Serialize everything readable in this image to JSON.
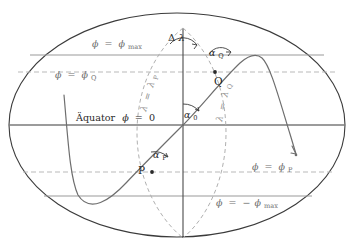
{
  "figure": {
    "type": "great-circle-geodesy-diagram",
    "language": "de",
    "background": "#ffffff",
    "size": {
      "width": 355,
      "height": 250
    }
  },
  "colors": {
    "ellipse_outline": "#3b3b3b",
    "equator_line": "#7a7a7a",
    "parallel_solid": "#9a9a9a",
    "parallel_dashed": "#b9b9b9",
    "meridian_dashed": "#b0b0b0",
    "great_circle": "#6e6e6e",
    "text": "#2a2a2a",
    "text_faint": "#6f6f6f",
    "angle_arc": "#3b3b3b"
  },
  "labels": {
    "equator": "Äquator ϕ = 0",
    "phi_max": "ϕ = ϕmax",
    "phi_q": "ϕ = ϕQ",
    "phi_p": "ϕ = ϕP",
    "phi_neg_max": "ϕ = −ϕmax",
    "lambda_p": "λ = λP",
    "lambda_q": "λ = λQ",
    "delta_lambda": "Δλ",
    "alpha_0": "α0",
    "alpha_p": "αP",
    "alpha_q": "αQ",
    "point_p": "P",
    "point_q": "Q"
  },
  "label_parts": {
    "phi": "ϕ",
    "eq": "=",
    "lambda": "λ",
    "minus": "−",
    "sub_max": "max",
    "sub_q": "Q",
    "sub_p": "P",
    "sub_0": "0",
    "equator_word": "Äquator",
    "zero": "0",
    "alpha": "α",
    "delta": "Δ"
  },
  "geometry": {
    "ellipse": {
      "cx": 177,
      "cy": 125,
      "rx": 168,
      "ry": 112
    },
    "pole_north": {
      "x": 183,
      "y": 28
    },
    "pole_south": {
      "x": 183,
      "y": 238
    },
    "lines": {
      "equator_y": 125,
      "phi_max_y": 55,
      "phi_q_y": 72,
      "phi_p_y": 172,
      "phi_neg_max_y": 196
    },
    "points": {
      "P": {
        "x": 152,
        "y": 172
      },
      "Q": {
        "x": 215,
        "y": 72
      },
      "node": {
        "x": 183,
        "y": 125
      },
      "curve_peak": {
        "x": 258,
        "y": 55
      },
      "curve_trough": {
        "x": 78,
        "y": 196
      },
      "curve_end_arrow": {
        "x": 297,
        "y": 156
      }
    },
    "meridian_dashed_rx": {
      "lambda_p": 46,
      "lambda_q": 43
    }
  },
  "annotations": [
    {
      "name": "delta-lambda-angle",
      "label": "Δλ",
      "at": {
        "x": 175,
        "y": 40
      }
    },
    {
      "name": "alpha-0-angle",
      "label": "α0",
      "at": {
        "x": 190,
        "y": 117
      }
    },
    {
      "name": "alpha-p-angle",
      "label": "αP",
      "at": {
        "x": 160,
        "y": 155
      }
    },
    {
      "name": "alpha-q-angle",
      "label": "αQ",
      "at": {
        "x": 219,
        "y": 53
      }
    }
  ]
}
